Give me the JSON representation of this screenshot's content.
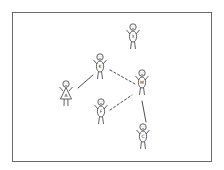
{
  "diagram": {
    "type": "social-network-stick-figures",
    "stroke_color": "#3a3a3a",
    "frame_color": "#6a6a6a",
    "background": "#ffffff",
    "nodes": [
      {
        "id": "X",
        "label": "X",
        "x": 133,
        "y": 27,
        "shape": "oval-body"
      },
      {
        "id": "K",
        "label": "K",
        "x": 100,
        "y": 57,
        "shape": "oval-body"
      },
      {
        "id": "A",
        "label": "A",
        "x": 66,
        "y": 84,
        "shape": "triangle-dress"
      },
      {
        "id": "M",
        "label": "M",
        "x": 142,
        "y": 73,
        "shape": "oval-body"
      },
      {
        "id": "F",
        "label": "F",
        "x": 101,
        "y": 102,
        "shape": "oval-body"
      },
      {
        "id": "C",
        "label": "C",
        "x": 143,
        "y": 127,
        "shape": "oval-body"
      }
    ],
    "edges": [
      {
        "from": "A",
        "to": "K",
        "style": "solid",
        "x1": 78,
        "y1": 88,
        "x2": 93,
        "y2": 75
      },
      {
        "from": "K",
        "to": "M",
        "style": "dashed",
        "x1": 110,
        "y1": 70,
        "x2": 135,
        "y2": 84
      },
      {
        "from": "F",
        "to": "M",
        "style": "dashed",
        "x1": 110,
        "y1": 110,
        "x2": 132,
        "y2": 95
      },
      {
        "from": "M",
        "to": "C",
        "style": "solid",
        "x1": 142,
        "y1": 101,
        "x2": 146,
        "y2": 122
      }
    ]
  }
}
